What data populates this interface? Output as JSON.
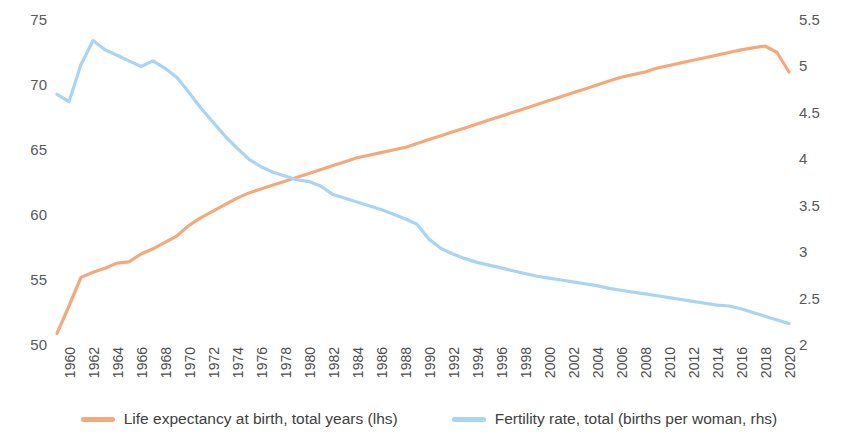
{
  "chart_data": {
    "type": "line",
    "title": "",
    "subtitle": "",
    "xlabel": "",
    "ylabel": "",
    "grid": false,
    "legend_position": "bottom",
    "x": [
      1960,
      1961,
      1962,
      1963,
      1964,
      1965,
      1966,
      1967,
      1968,
      1969,
      1970,
      1971,
      1972,
      1973,
      1974,
      1975,
      1976,
      1977,
      1978,
      1979,
      1980,
      1981,
      1982,
      1983,
      1984,
      1985,
      1986,
      1987,
      1988,
      1989,
      1990,
      1991,
      1992,
      1993,
      1994,
      1995,
      1996,
      1997,
      1998,
      1999,
      2000,
      2001,
      2002,
      2003,
      2004,
      2005,
      2006,
      2007,
      2008,
      2009,
      2010,
      2011,
      2012,
      2013,
      2014,
      2015,
      2016,
      2017,
      2018,
      2019,
      2020,
      2021
    ],
    "x_tick_labels": [
      "1960",
      "1962",
      "1964",
      "1966",
      "1968",
      "1970",
      "1972",
      "1974",
      "1976",
      "1978",
      "1980",
      "1982",
      "1984",
      "1986",
      "1988",
      "1990",
      "1992",
      "1994",
      "1996",
      "1998",
      "2000",
      "2002",
      "2004",
      "2006",
      "2008",
      "2010",
      "2012",
      "2014",
      "2016",
      "2018",
      "2020"
    ],
    "axes": [
      {
        "id": "lhs",
        "side": "left",
        "ylim": [
          50,
          75
        ],
        "ticks": [
          50,
          55,
          60,
          65,
          70,
          75
        ],
        "tick_labels": [
          "50",
          "55",
          "60",
          "65",
          "70",
          "75"
        ]
      },
      {
        "id": "rhs",
        "side": "right",
        "ylim": [
          2,
          5.5
        ],
        "ticks": [
          2,
          2.5,
          3,
          3.5,
          4,
          4.5,
          5,
          5.5
        ],
        "tick_labels": [
          "2",
          "2.5",
          "3",
          "3.5",
          "4",
          "4.5",
          "5",
          "5.5"
        ]
      }
    ],
    "series": [
      {
        "name": "Life expectancy at birth, total years (lhs)",
        "axis": "lhs",
        "color": "#F4A97A",
        "values": [
          50.9,
          53.0,
          55.2,
          55.6,
          55.9,
          56.3,
          56.4,
          57.0,
          57.4,
          57.9,
          58.4,
          59.2,
          59.8,
          60.3,
          60.8,
          61.3,
          61.7,
          62.0,
          62.3,
          62.6,
          62.9,
          63.2,
          63.5,
          63.8,
          64.1,
          64.4,
          64.6,
          64.8,
          65.0,
          65.2,
          65.5,
          65.8,
          66.1,
          66.4,
          66.7,
          67.0,
          67.3,
          67.6,
          67.9,
          68.2,
          68.5,
          68.8,
          69.1,
          69.4,
          69.7,
          70.0,
          70.3,
          70.6,
          70.8,
          71.0,
          71.3,
          71.5,
          71.7,
          71.9,
          72.1,
          72.3,
          72.5,
          72.7,
          72.85,
          73.0,
          72.5,
          71.0
        ]
      },
      {
        "name": "Fertility rate, total (births per woman, rhs)",
        "axis": "rhs",
        "color": "#A9D4F2",
        "values": [
          4.7,
          4.62,
          5.02,
          5.28,
          5.18,
          5.12,
          5.06,
          5.0,
          5.06,
          4.98,
          4.88,
          4.72,
          4.55,
          4.4,
          4.25,
          4.12,
          4.0,
          3.92,
          3.86,
          3.82,
          3.78,
          3.76,
          3.71,
          3.62,
          3.58,
          3.54,
          3.5,
          3.46,
          3.41,
          3.36,
          3.3,
          3.14,
          3.04,
          2.98,
          2.93,
          2.89,
          2.86,
          2.83,
          2.8,
          2.77,
          2.74,
          2.72,
          2.7,
          2.68,
          2.66,
          2.64,
          2.61,
          2.59,
          2.57,
          2.55,
          2.53,
          2.51,
          2.49,
          2.47,
          2.45,
          2.43,
          2.42,
          2.39,
          2.35,
          2.31,
          2.27,
          2.23
        ]
      }
    ]
  }
}
